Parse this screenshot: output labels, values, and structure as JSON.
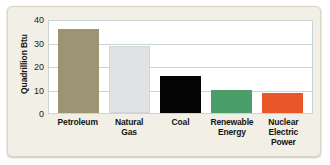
{
  "chart_data": {
    "type": "bar",
    "title": "",
    "subtitle": "",
    "xlabel": "",
    "ylabel": "Quadrillion Btu",
    "categories": [
      "Petroleum",
      "Natural Gas",
      "Coal",
      "Renewable Energy",
      "Nuclear Electric Power"
    ],
    "category_lines": [
      [
        "Petroleum"
      ],
      [
        "Natural",
        "Gas"
      ],
      [
        "Coal"
      ],
      [
        "Renewable",
        "Energy"
      ],
      [
        "Nuclear",
        "Electric",
        "Power"
      ]
    ],
    "values": [
      35.8,
      28.4,
      15.6,
      9.6,
      8.5
    ],
    "colors": [
      "#9c9472",
      "#dfe3e4",
      "#050505",
      "#4a9e6a",
      "#e8562a"
    ],
    "ylim": [
      0,
      40
    ],
    "yticks": [
      0,
      10,
      20,
      30,
      40
    ],
    "ytick_labels": [
      "0",
      "10",
      "20",
      "30",
      "40"
    ],
    "grid": true,
    "legend": "none",
    "series": [
      {
        "name": "Energy consumption",
        "values": [
          35.8,
          28.4,
          15.6,
          9.6,
          8.5
        ]
      }
    ]
  },
  "theme": {
    "card_background": "#f2f0e6",
    "plot_background": "#ffffff",
    "grid_color": "#c9d4d6",
    "text_color": "#131313"
  }
}
